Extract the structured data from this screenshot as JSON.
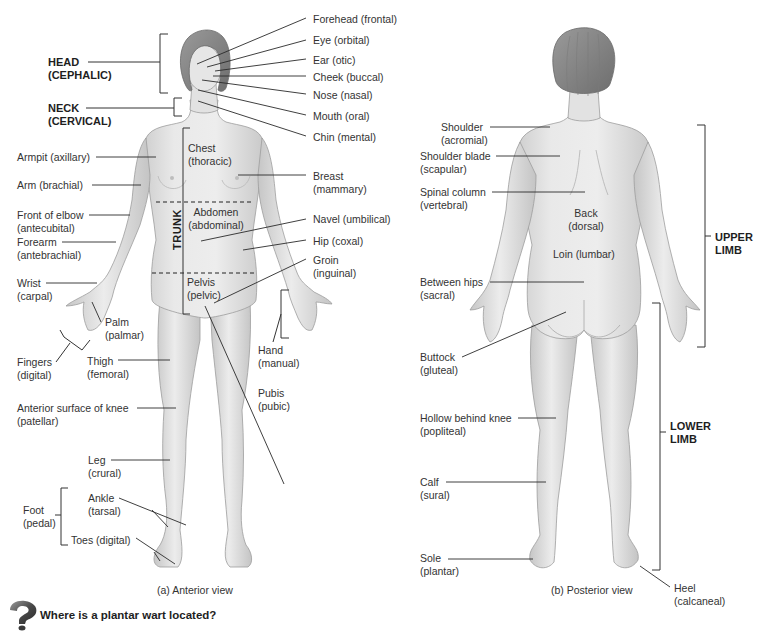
{
  "figure": {
    "anterior": {
      "caption": "(a) Anterior view",
      "regions": {
        "head": {
          "line1": "HEAD",
          "line2": "(CEPHALIC)"
        },
        "neck": {
          "line1": "NECK",
          "line2": "(CERVICAL)"
        },
        "trunk": "TRUNK"
      },
      "trunk_labels": {
        "chest": {
          "line1": "Chest",
          "line2": "(thoracic)"
        },
        "abdomen": {
          "line1": "Abdomen",
          "line2": "(abdominal)"
        },
        "pelvis": {
          "line1": "Pelvis",
          "line2": "(pelvic)"
        }
      },
      "left_labels": [
        {
          "line1": "Armpit (axillary)",
          "line2": ""
        },
        {
          "line1": "Arm (brachial)",
          "line2": ""
        },
        {
          "line1": "Front of elbow",
          "line2": "(antecubital)"
        },
        {
          "line1": "Forearm",
          "line2": "(antebrachial)"
        },
        {
          "line1": "Wrist",
          "line2": "(carpal)"
        },
        {
          "line1": "Palm",
          "line2": "(palmar)"
        },
        {
          "line1": "Fingers",
          "line2": "(digital)"
        },
        {
          "line1": "Thigh",
          "line2": "(femoral)"
        },
        {
          "line1": "Anterior surface of knee",
          "line2": "(patellar)"
        },
        {
          "line1": "Leg",
          "line2": "(crural)"
        },
        {
          "line1": "Foot",
          "line2": "(pedal)"
        },
        {
          "line1": "Ankle",
          "line2": "(tarsal)"
        },
        {
          "line1": "Toes (digital)",
          "line2": ""
        }
      ],
      "right_labels": [
        {
          "line1": "Forehead (frontal)",
          "line2": ""
        },
        {
          "line1": "Eye (orbital)",
          "line2": ""
        },
        {
          "line1": "Ear (otic)",
          "line2": ""
        },
        {
          "line1": "Cheek (buccal)",
          "line2": ""
        },
        {
          "line1": "Nose (nasal)",
          "line2": ""
        },
        {
          "line1": "Mouth (oral)",
          "line2": ""
        },
        {
          "line1": "Chin (mental)",
          "line2": ""
        },
        {
          "line1": "Breast",
          "line2": "(mammary)"
        },
        {
          "line1": "Navel (umbilical)",
          "line2": ""
        },
        {
          "line1": "Hip (coxal)",
          "line2": ""
        },
        {
          "line1": "Groin",
          "line2": "(inguinal)"
        },
        {
          "line1": "Hand",
          "line2": "(manual)"
        },
        {
          "line1": "Pubis",
          "line2": "(pubic)"
        }
      ]
    },
    "posterior": {
      "caption": "(b) Posterior view",
      "left_labels": [
        {
          "line1": "Shoulder",
          "line2": "(acromial)"
        },
        {
          "line1": "Shoulder blade",
          "line2": "(scapular)"
        },
        {
          "line1": "Spinal column",
          "line2": "(vertebral)"
        },
        {
          "line1": "Between hips",
          "line2": "(sacral)"
        },
        {
          "line1": "Buttock",
          "line2": "(gluteal)"
        },
        {
          "line1": "Hollow behind knee",
          "line2": "(popliteal)"
        },
        {
          "line1": "Calf",
          "line2": "(sural)"
        },
        {
          "line1": "Sole",
          "line2": "(plantar)"
        }
      ],
      "body_labels": {
        "back": {
          "line1": "Back",
          "line2": "(dorsal)"
        },
        "loin": "Loin (lumbar)"
      },
      "heel": {
        "line1": "Heel",
        "line2": "(calcaneal)"
      },
      "regions": {
        "upper_limb": {
          "line1": "UPPER",
          "line2": "LIMB"
        },
        "lower_limb": {
          "line1": "LOWER",
          "line2": "LIMB"
        }
      }
    }
  },
  "question": {
    "icon": "question-mark-icon",
    "text": "Where is a plantar wart located?"
  },
  "colors": {
    "skin": "#e4e4e4",
    "skin_shadow": "#c8c8c8",
    "hair": "#8a8a8a",
    "line": "#2a2a2a",
    "text": "#333333"
  }
}
